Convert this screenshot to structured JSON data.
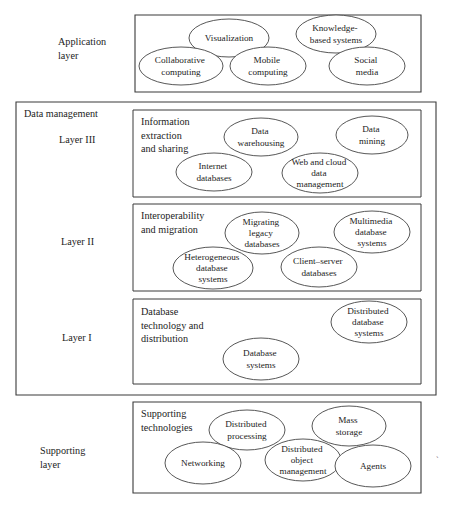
{
  "figure": {
    "stray_mark": "`"
  },
  "layers": {
    "application": {
      "side_label_line1": "Application",
      "side_label_line2": "layer",
      "nodes": [
        {
          "label": "Visualization",
          "lines": [
            "Visualization"
          ]
        },
        {
          "label": "Knowledge-based systems",
          "lines": [
            "Knowledge-",
            "based systems"
          ]
        },
        {
          "label": "Collaborative computing",
          "lines": [
            "Collaborative",
            "computing"
          ]
        },
        {
          "label": "Mobile computing",
          "lines": [
            "Mobile",
            "computing"
          ]
        },
        {
          "label": "Social media",
          "lines": [
            "Social",
            "media"
          ]
        }
      ]
    },
    "data_management": {
      "group_label": "Data management",
      "layer3": {
        "side_label": "Layer III",
        "box_title_lines": [
          "Information",
          "extraction",
          "and sharing"
        ],
        "nodes": [
          {
            "label": "Data warehousing",
            "lines": [
              "Data",
              "warehousing"
            ]
          },
          {
            "label": "Data mining",
            "lines": [
              "Data",
              "mining"
            ]
          },
          {
            "label": "Internet databases",
            "lines": [
              "Internet",
              "databases"
            ]
          },
          {
            "label": "Web and cloud data management",
            "lines": [
              "Web and cloud",
              "data",
              "management"
            ]
          }
        ]
      },
      "layer2": {
        "side_label": "Layer II",
        "box_title_lines": [
          "Interoperability",
          "and migration"
        ],
        "nodes": [
          {
            "label": "Migrating legacy databases",
            "lines": [
              "Migrating",
              "legacy",
              "databases"
            ]
          },
          {
            "label": "Multimedia database systems",
            "lines": [
              "Multimedia",
              "database",
              "systems"
            ]
          },
          {
            "label": "Heterogeneous database systems",
            "lines": [
              "Heterogeneous",
              "database",
              "systems"
            ]
          },
          {
            "label": "Client-server databases",
            "lines": [
              "Client–server",
              "databases"
            ]
          }
        ]
      },
      "layer1": {
        "side_label": "Layer I",
        "box_title_lines": [
          "Database",
          "technology and",
          "distribution"
        ],
        "nodes": [
          {
            "label": "Distributed database systems",
            "lines": [
              "Distributed",
              "database",
              "systems"
            ]
          },
          {
            "label": "Database systems",
            "lines": [
              "Database",
              "systems"
            ]
          }
        ]
      }
    },
    "supporting": {
      "side_label_line1": "Supporting",
      "side_label_line2": "layer",
      "box_title_lines": [
        "Supporting",
        "technologies"
      ],
      "nodes": [
        {
          "label": "Distributed processing",
          "lines": [
            "Distributed",
            "processing"
          ]
        },
        {
          "label": "Mass storage",
          "lines": [
            "Mass",
            "storage"
          ]
        },
        {
          "label": "Networking",
          "lines": [
            "Networking"
          ]
        },
        {
          "label": "Distributed object management",
          "lines": [
            "Distributed",
            "object",
            "management"
          ]
        },
        {
          "label": "Agents",
          "lines": [
            "Agents"
          ]
        }
      ]
    }
  }
}
